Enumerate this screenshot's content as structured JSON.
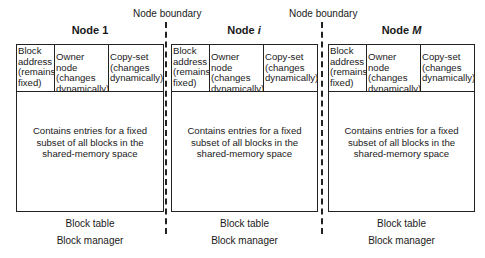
{
  "boundaries": [
    {
      "label": "Node boundary",
      "label_x": 120,
      "line_x": 166
    },
    {
      "label": "Node boundary",
      "label_x": 276,
      "line_x": 322
    }
  ],
  "nodes": [
    {
      "title_prefix": "Node ",
      "title_var": "1",
      "headers": [
        "Block address (remains fixed)",
        "Owner node (changes dynamically)",
        "Copy-set (changes dynamically)"
      ],
      "body": "Contains entries for a fixed subset of all blocks in the shared-memory space",
      "table_label": "Block table",
      "manager_label": "Block manager"
    },
    {
      "title_prefix": "Node ",
      "title_var": "i",
      "headers": [
        "Block address (remains fixed)",
        "Owner node (changes dynamically)",
        "Copy-set (changes dynamically)"
      ],
      "body": "Contains entries for a fixed subset of all blocks in the shared-memory space",
      "table_label": "Block table",
      "manager_label": "Block manager"
    },
    {
      "title_prefix": "Node ",
      "title_var": "M",
      "headers": [
        "Block address (remains fixed)",
        "Owner node (changes dynamically)",
        "Copy-set (changes dynamically)"
      ],
      "body": "Contains entries for a fixed subset of all blocks in the shared-memory space",
      "table_label": "Block table",
      "manager_label": "Block manager"
    }
  ]
}
